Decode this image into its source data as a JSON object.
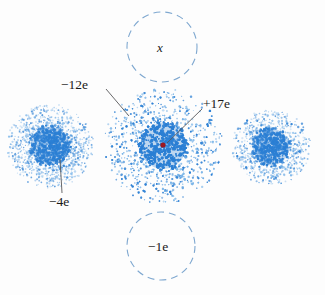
{
  "figure": {
    "background_color": "#fdfdfd"
  },
  "labels": {
    "shell_charge": "−12e",
    "nucleus_charge": "+17e",
    "left_atom_charge": "−4e",
    "unknown_marker": "x",
    "bottom_charge": "−1e"
  },
  "colors": {
    "cloud_blue": "#2b7fd4",
    "cloud_blue_light": "#79b4e8",
    "nucleus_red": "#9c1820",
    "dashed_circle": "#7fa8d0",
    "leader_line": "#58585a",
    "text": "#1a1a1a"
  },
  "objects": [
    {
      "name": "left-electron-cloud",
      "kind": "electron-cloud",
      "cx": 50,
      "cy": 146,
      "outer_radius": 43,
      "core_radius": 21,
      "label": "−4e"
    },
    {
      "name": "center-electron-cloud",
      "kind": "electron-cloud",
      "cx": 163,
      "cy": 146,
      "outer_radius": 59,
      "core_radius": 25,
      "label": "−12e"
    },
    {
      "name": "right-electron-cloud",
      "kind": "electron-cloud",
      "cx": 271,
      "cy": 147,
      "outer_radius": 39,
      "core_radius": 20,
      "label": ""
    },
    {
      "name": "nucleus-dot",
      "kind": "nucleus",
      "cx": 163,
      "cy": 145,
      "radius": 2.6,
      "label": "+17e"
    },
    {
      "name": "top-dashed-circle",
      "kind": "dashed-circle",
      "cx": 162,
      "cy": 47,
      "radius": 35,
      "label": "x"
    },
    {
      "name": "bottom-dashed-circle",
      "kind": "dashed-circle",
      "cx": 161,
      "cy": 246,
      "radius": 34,
      "label": "−1e"
    }
  ],
  "leader_lines": [
    {
      "name": "leader-minus12e",
      "x1": 106,
      "y1": 89,
      "x2": 129,
      "y2": 116
    },
    {
      "name": "leader-plus17e",
      "x1": 202,
      "y1": 109,
      "x2": 167,
      "y2": 143
    },
    {
      "name": "leader-minus4e",
      "x1": 60,
      "y1": 159,
      "x2": 62,
      "y2": 193
    }
  ],
  "chart_data": {
    "type": "scatter",
    "xlabel": "",
    "ylabel": "",
    "xlim": [
      0,
      325
    ],
    "ylim": [
      0,
      295
    ],
    "grid": false,
    "legend": "none",
    "series": [
      {
        "name": "left cloud (−4e)",
        "center": [
          50,
          146
        ],
        "outer_radius": 43,
        "core_radius": 21,
        "n_points": 2600
      },
      {
        "name": "center cloud (−12e)",
        "center": [
          163,
          146
        ],
        "outer_radius": 59,
        "core_radius": 25,
        "n_points": 4600
      },
      {
        "name": "right cloud",
        "center": [
          271,
          147
        ],
        "outer_radius": 39,
        "core_radius": 20,
        "n_points": 2300
      },
      {
        "name": "nucleus (+17e)",
        "center": [
          163,
          145
        ],
        "outer_radius": 2.6,
        "core_radius": 2.6,
        "n_points": 1
      }
    ],
    "annotations": [
      {
        "text": "−12e",
        "x": 61,
        "y": 85
      },
      {
        "text": "+17e",
        "x": 203,
        "y": 104
      },
      {
        "text": "−4e",
        "x": 49,
        "y": 202
      },
      {
        "text": "x",
        "x": 162,
        "y": 47
      },
      {
        "text": "−1e",
        "x": 161,
        "y": 246
      }
    ]
  }
}
